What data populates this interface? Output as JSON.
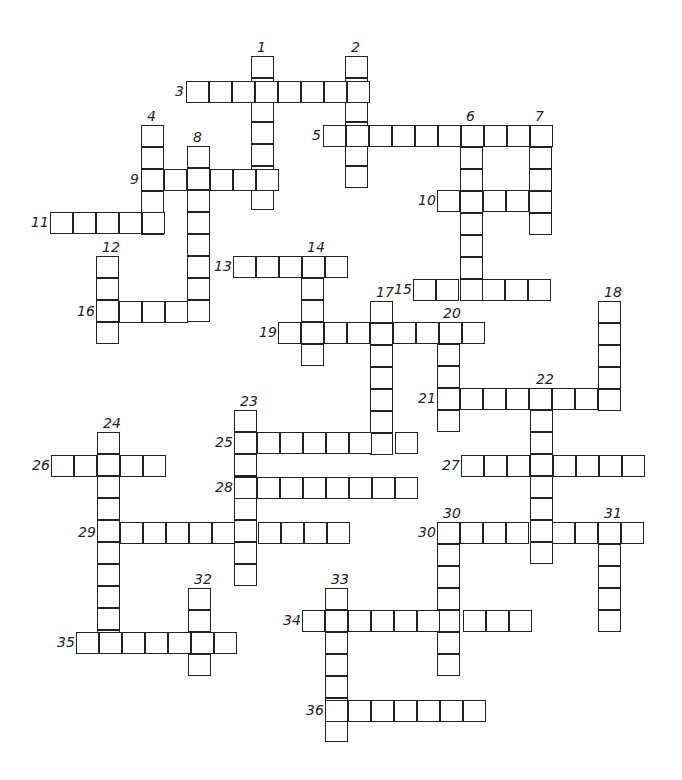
{
  "puzzle": {
    "cell_w": 23,
    "cell_h": 22,
    "words": [
      {
        "n": "1",
        "dir": "down",
        "x": 251,
        "y": 56,
        "len": 7
      },
      {
        "n": "2",
        "dir": "down",
        "x": 345,
        "y": 56,
        "len": 6
      },
      {
        "n": "3",
        "dir": "across",
        "x": 186,
        "y": 81,
        "len": 8
      },
      {
        "n": "4",
        "dir": "down",
        "x": 141,
        "y": 125,
        "len": 5
      },
      {
        "n": "5",
        "dir": "across",
        "x": 323,
        "y": 125,
        "len": 10
      },
      {
        "n": "6",
        "dir": "down",
        "x": 460,
        "y": 125,
        "len": 8
      },
      {
        "n": "7",
        "dir": "down",
        "x": 529,
        "y": 125,
        "len": 5
      },
      {
        "n": "8",
        "dir": "down",
        "x": 187,
        "y": 146,
        "len": 8
      },
      {
        "n": "9",
        "dir": "across",
        "x": 141,
        "y": 169,
        "len": 6
      },
      {
        "n": "10",
        "dir": "across",
        "x": 437,
        "y": 190,
        "len": 5
      },
      {
        "n": "11",
        "dir": "across",
        "x": 50,
        "y": 212,
        "len": 5
      },
      {
        "n": "12",
        "dir": "down",
        "x": 96,
        "y": 256,
        "len": 4
      },
      {
        "n": "13",
        "dir": "across",
        "x": 233,
        "y": 256,
        "len": 5
      },
      {
        "n": "14",
        "dir": "down",
        "x": 301,
        "y": 256,
        "len": 5
      },
      {
        "n": "15",
        "dir": "across",
        "x": 413,
        "y": 279,
        "len": 6
      },
      {
        "n": "16",
        "dir": "across",
        "x": 96,
        "y": 301,
        "len": 5
      },
      {
        "n": "17",
        "dir": "down",
        "x": 370,
        "y": 301,
        "len": 7
      },
      {
        "n": "18",
        "dir": "down",
        "x": 598,
        "y": 301,
        "len": 5
      },
      {
        "n": "19",
        "dir": "across",
        "x": 278,
        "y": 322,
        "len": 9
      },
      {
        "n": "20",
        "dir": "down",
        "x": 437,
        "y": 322,
        "len": 5
      },
      {
        "n": "21",
        "dir": "across",
        "x": 437,
        "y": 388,
        "len": 8
      },
      {
        "n": "22",
        "dir": "down",
        "x": 530,
        "y": 388,
        "len": 8
      },
      {
        "n": "23",
        "dir": "down",
        "x": 234,
        "y": 410,
        "len": 8
      },
      {
        "n": "24",
        "dir": "down",
        "x": 97,
        "y": 432,
        "len": 10
      },
      {
        "n": "25",
        "dir": "across",
        "x": 234,
        "y": 432,
        "len": 8
      },
      {
        "n": "26",
        "dir": "across",
        "x": 51,
        "y": 455,
        "len": 5
      },
      {
        "n": "27",
        "dir": "across",
        "x": 461,
        "y": 455,
        "len": 8
      },
      {
        "n": "28",
        "dir": "across",
        "x": 234,
        "y": 477,
        "len": 8
      },
      {
        "n": "29",
        "dir": "across",
        "x": 97,
        "y": 522,
        "len": 11
      },
      {
        "n": "30",
        "dir": "across",
        "x": 437,
        "y": 522,
        "len": 9
      },
      {
        "n": "30",
        "dir": "down",
        "x": 437,
        "y": 522,
        "len": 7
      },
      {
        "n": "31",
        "dir": "down",
        "x": 598,
        "y": 522,
        "len": 5
      },
      {
        "n": "32",
        "dir": "down",
        "x": 188,
        "y": 588,
        "len": 4
      },
      {
        "n": "33",
        "dir": "down",
        "x": 325,
        "y": 588,
        "len": 7
      },
      {
        "n": "34",
        "dir": "across",
        "x": 302,
        "y": 610,
        "len": 10
      },
      {
        "n": "35",
        "dir": "across",
        "x": 76,
        "y": 632,
        "len": 7
      },
      {
        "n": "36",
        "dir": "across",
        "x": 325,
        "y": 700,
        "len": 7
      }
    ]
  }
}
